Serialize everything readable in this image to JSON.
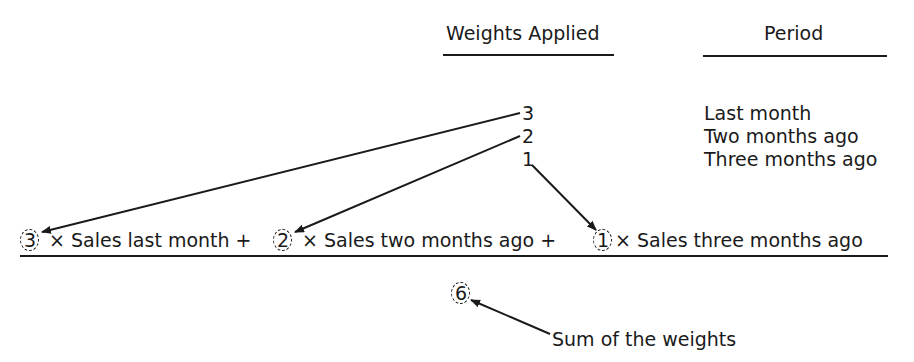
{
  "headers": {
    "weights": "Weights Applied",
    "period": "Period"
  },
  "rows": [
    {
      "weight": "3",
      "period": "Last month"
    },
    {
      "weight": "2",
      "period": "Two months ago"
    },
    {
      "weight": "1",
      "period": "Three months ago"
    }
  ],
  "formula": {
    "terms": [
      {
        "weight": "3",
        "label": "× Sales last month +"
      },
      {
        "weight": "2",
        "label": "× Sales two months ago +"
      },
      {
        "weight": "1",
        "label": "× Sales three months ago"
      }
    ],
    "denominator": "6"
  },
  "annotation": {
    "sum_label": "Sum of the weights"
  }
}
